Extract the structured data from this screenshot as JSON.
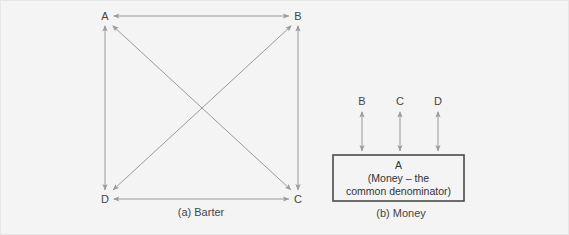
{
  "figure": {
    "background_color": "#f4f4f4",
    "line_color": "#9a9a9a",
    "box_border_color": "#4a4a4a",
    "text_color": "#444444"
  },
  "panel_a": {
    "caption": "(a) Barter",
    "nodes": [
      {
        "id": "A",
        "label": "A",
        "x": 104,
        "y": 16
      },
      {
        "id": "B",
        "label": "B",
        "x": 297,
        "y": 16
      },
      {
        "id": "D",
        "label": "D",
        "x": 104,
        "y": 199
      },
      {
        "id": "C",
        "label": "C",
        "x": 297,
        "y": 199
      }
    ],
    "edges": [
      {
        "from": "A",
        "to": "B",
        "kind": "double-arrow"
      },
      {
        "from": "D",
        "to": "C",
        "kind": "double-arrow"
      },
      {
        "from": "A",
        "to": "D",
        "kind": "double-arrow"
      },
      {
        "from": "B",
        "to": "C",
        "kind": "double-arrow"
      },
      {
        "from": "A",
        "to": "C",
        "kind": "double-arrow"
      },
      {
        "from": "B",
        "to": "D",
        "kind": "double-arrow"
      }
    ]
  },
  "panel_b": {
    "caption": "(b) Money",
    "nodes": [
      {
        "id": "B",
        "label": "B",
        "x": 361,
        "y": 101
      },
      {
        "id": "C",
        "label": "C",
        "x": 399,
        "y": 101
      },
      {
        "id": "D",
        "label": "D",
        "x": 437,
        "y": 101
      }
    ],
    "edges": [
      {
        "from": "B",
        "to": "A",
        "kind": "double-arrow"
      },
      {
        "from": "C",
        "to": "A",
        "kind": "double-arrow"
      },
      {
        "from": "D",
        "to": "A",
        "kind": "double-arrow"
      }
    ],
    "center_box": {
      "line1": "A",
      "line2": "(Money – the",
      "line3": "common denominator)"
    }
  }
}
